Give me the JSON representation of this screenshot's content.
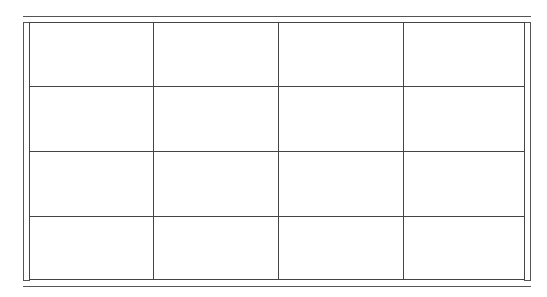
{
  "table": {
    "rows": 4,
    "columns": 4,
    "cells": [
      [
        "",
        "",
        "",
        ""
      ],
      [
        "",
        "",
        "",
        ""
      ],
      [
        "",
        "",
        "",
        ""
      ],
      [
        "",
        "",
        "",
        ""
      ]
    ],
    "line_color": "#444444",
    "frame_color": "#555555"
  }
}
